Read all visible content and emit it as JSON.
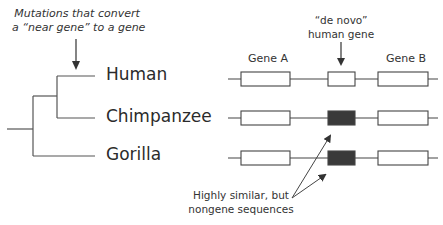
{
  "annotation_top": {
    "line1": "Mutations that convert",
    "line2": "a “near gene” to a gene"
  },
  "tree": {
    "species": [
      {
        "name": "Human"
      },
      {
        "name": "Chimpanzee"
      },
      {
        "name": "Gorilla"
      }
    ]
  },
  "genes": {
    "gene_a_label": "Gene A",
    "gene_b_label": "Gene B",
    "de_novo_line1": "“de novo”",
    "de_novo_line2": "human gene",
    "rows": [
      {
        "species": "Human",
        "middle_box": "open"
      },
      {
        "species": "Chimpanzee",
        "middle_box": "filled"
      },
      {
        "species": "Gorilla",
        "middle_box": "filled"
      }
    ],
    "filled_color": "#3a3a3a"
  },
  "annotation_bottom": {
    "line1": "Highly similar, but",
    "line2": "nongene sequences"
  }
}
